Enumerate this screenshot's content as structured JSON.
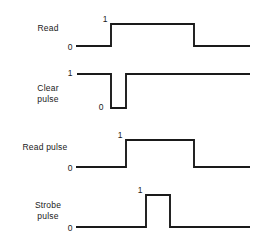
{
  "diagram": {
    "stroke_color": "#1a1a1a",
    "background_color": "#ffffff",
    "signals": [
      {
        "name": "read",
        "label": "Read",
        "label_x": 48,
        "label_y": 23,
        "low_label": "0",
        "low_label_x": 70,
        "low_label_y": 43,
        "high_label": "1",
        "high_label_x": 105,
        "high_label_y": 15,
        "high_y": 24,
        "low_y": 46,
        "start_x": 76,
        "end_x": 250,
        "transitions": [
          {
            "x": 111,
            "to": "high"
          },
          {
            "x": 194,
            "to": "low"
          }
        ],
        "initial_level": "low"
      },
      {
        "name": "clear-pulse",
        "label": "Clear\npulse",
        "label_x": 48,
        "label_y": 83,
        "low_label": "0",
        "low_label_x": 101,
        "low_label_y": 103,
        "high_label": "1",
        "high_label_x": 70,
        "high_label_y": 69,
        "high_y": 74,
        "low_y": 108,
        "start_x": 77,
        "end_x": 250,
        "transitions": [
          {
            "x": 111,
            "to": "low"
          },
          {
            "x": 126,
            "to": "high"
          }
        ],
        "initial_level": "high"
      },
      {
        "name": "read-pulse",
        "label": "Read  pulse",
        "label_x": 45,
        "label_y": 142,
        "low_label": "0",
        "low_label_x": 70,
        "low_label_y": 164,
        "high_label": "1",
        "high_label_x": 120,
        "high_label_y": 131,
        "high_y": 140,
        "low_y": 167,
        "start_x": 76,
        "end_x": 250,
        "transitions": [
          {
            "x": 126,
            "to": "high"
          },
          {
            "x": 194,
            "to": "low"
          }
        ],
        "initial_level": "low"
      },
      {
        "name": "strobe-pulse",
        "label": "Strobe\npulse",
        "label_x": 48,
        "label_y": 200,
        "low_label": "0",
        "low_label_x": 70,
        "low_label_y": 224,
        "high_label": "1",
        "high_label_x": 140,
        "high_label_y": 186,
        "high_y": 195,
        "low_y": 227,
        "start_x": 76,
        "end_x": 250,
        "transitions": [
          {
            "x": 146,
            "to": "high"
          },
          {
            "x": 170,
            "to": "low"
          }
        ],
        "initial_level": "low"
      }
    ]
  }
}
